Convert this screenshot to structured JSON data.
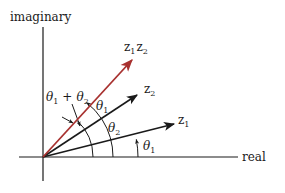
{
  "axes": {
    "vertical_label": "imaginary",
    "horizontal_label": "real"
  },
  "vectors": [
    {
      "id": "z1",
      "label": "z",
      "subscript": "1",
      "color": "#1a1a1a"
    },
    {
      "id": "z2",
      "label": "z",
      "subscript": "2",
      "color": "#1a1a1a"
    },
    {
      "id": "z1z2",
      "label_a": "z",
      "subscript_a": "1",
      "label_b": "z",
      "subscript_b": "2",
      "color": "#a8312f"
    }
  ],
  "angles": {
    "sum_label": {
      "theta": "θ",
      "sub1": "1",
      "plus": "+",
      "theta2": "θ",
      "sub2": "2"
    },
    "theta1_upper": {
      "theta": "θ",
      "sub": "1"
    },
    "theta2_middle": {
      "theta": "θ",
      "sub": "2"
    },
    "theta1_lower": {
      "theta": "θ",
      "sub": "1"
    }
  },
  "colors": {
    "product_vector": "#a8312f",
    "ink": "#1a1a1a"
  }
}
